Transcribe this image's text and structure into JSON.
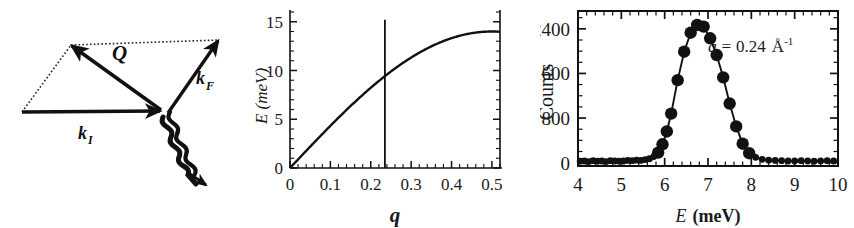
{
  "figure": {
    "background": "#ffffff",
    "ink_color": "#111111",
    "panel_count": 3
  },
  "panels": {
    "scattering_diagram": {
      "name": "neutron-scattering-vector-diagram",
      "labels": {
        "q_vector": "Q",
        "ki_vector": "k",
        "ki_subscript": "I",
        "kf_vector": "k",
        "kf_subscript": "F",
        "phonon_wave": "phonon-squiggle"
      },
      "geometry_note": "vector triangle: k_I horizontal, k_F up-right, Q up-left, dotted parallelogram closure"
    },
    "dispersion": {
      "name": "phonon-dispersion-plot",
      "marker_line_q": 0.235
    },
    "spectrum": {
      "name": "constant-q-energy-scan",
      "annotation": "q = 0.24 Å⁻¹",
      "annotation_parts": {
        "symbol": "q",
        "equals": "=",
        "value": "0.24",
        "unit": "Å",
        "exponent": "-1"
      }
    }
  },
  "chart_data": [
    {
      "type": "line",
      "name": "dispersion-curve",
      "title": "",
      "xlabel": "q",
      "ylabel": "E (meV)",
      "xlim": [
        0,
        0.52
      ],
      "ylim": [
        0,
        16
      ],
      "xticks": [
        0,
        0.1,
        0.2,
        0.3,
        0.4,
        0.5
      ],
      "xticklabels": [
        "0",
        "0.1",
        "0.2",
        "0.3",
        "0.4",
        "0.5"
      ],
      "yticks": [
        0,
        5,
        10,
        15
      ],
      "yticklabels": [
        "0",
        "5",
        "10",
        "15"
      ],
      "grid": false,
      "legend": "none",
      "x": [
        0.0,
        0.025,
        0.05,
        0.075,
        0.1,
        0.125,
        0.15,
        0.175,
        0.2,
        0.225,
        0.25,
        0.275,
        0.3,
        0.325,
        0.35,
        0.375,
        0.4,
        0.425,
        0.45,
        0.475,
        0.5,
        0.52
      ],
      "y": [
        0.0,
        0.82,
        1.63,
        2.43,
        3.23,
        4.0,
        4.76,
        5.49,
        6.19,
        6.87,
        7.5,
        8.1,
        8.65,
        9.16,
        9.62,
        10.02,
        10.37,
        10.66,
        10.89,
        11.05,
        11.15,
        11.17
      ],
      "y_actual_note": "curve is sinusoidal E = 14.0*sin(pi*q) scaled so E(0.5)=14.0",
      "annotations": [
        {
          "type": "vline",
          "x": 0.235,
          "y_from": 0,
          "y_to": 15.2,
          "label": "constant-q marker"
        }
      ]
    },
    {
      "type": "scatter",
      "name": "energy-scan-peak",
      "title": "",
      "xlabel": "E (meV)",
      "ylabel": "Counts",
      "xlim": [
        4.0,
        10.0
      ],
      "ylim": [
        -60,
        2720
      ],
      "xticks": [
        4,
        5,
        6,
        7,
        8,
        9,
        10
      ],
      "xticklabels": [
        "4",
        "5",
        "6",
        "7",
        "8",
        "9",
        "10"
      ],
      "yticks": [
        0,
        800,
        1600,
        2400
      ],
      "yticklabels": [
        "0",
        "800",
        "1600",
        "2400"
      ],
      "grid": false,
      "legend": "none",
      "annotation_text": "q = 0.24 Å⁻¹",
      "x": [
        4.05,
        4.15,
        4.25,
        4.35,
        4.45,
        4.55,
        4.65,
        4.75,
        4.85,
        4.95,
        5.05,
        5.15,
        5.25,
        5.35,
        5.45,
        5.55,
        5.65,
        5.75,
        5.85,
        5.95,
        6.05,
        6.15,
        6.3,
        6.45,
        6.6,
        6.75,
        6.9,
        7.05,
        7.2,
        7.35,
        7.5,
        7.65,
        7.8,
        7.95,
        8.1,
        8.25,
        8.4,
        8.55,
        8.7,
        8.85,
        9.0,
        9.15,
        9.3,
        9.45,
        9.6,
        9.75,
        9.9
      ],
      "y": [
        25,
        30,
        20,
        35,
        25,
        30,
        20,
        35,
        30,
        25,
        30,
        40,
        35,
        45,
        40,
        55,
        70,
        110,
        180,
        330,
        560,
        880,
        1480,
        1990,
        2330,
        2470,
        2440,
        2230,
        1930,
        1530,
        1060,
        650,
        340,
        170,
        95,
        60,
        45,
        40,
        35,
        30,
        30,
        35,
        30,
        25,
        30,
        35,
        30
      ]
    }
  ]
}
